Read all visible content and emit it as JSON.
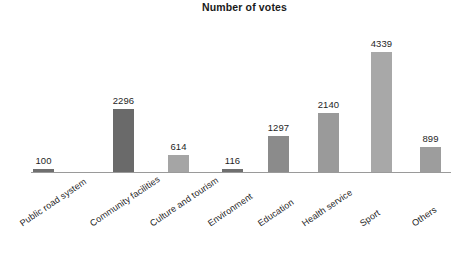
{
  "chart_data": {
    "type": "bar",
    "title": "Number of votes",
    "xlabel": "",
    "ylabel": "",
    "ylim": [
      0,
      4800
    ],
    "grid": false,
    "legend": false,
    "orientation": "vertical",
    "value_labels": true,
    "xtick_rotation": -34,
    "categories": [
      "Public road system",
      "Community facilities",
      "Culture and tourism",
      "Environment",
      "Education",
      "Health service",
      "Sport",
      "Others"
    ],
    "values": [
      100,
      2296,
      614,
      116,
      1297,
      2140,
      4339,
      899
    ],
    "value_label_text": [
      "100",
      "2296",
      "614",
      "116",
      "1297",
      "2140",
      "4339",
      "899"
    ],
    "bar_colors": [
      "#6f6f6f",
      "#6a6a6a",
      "#a5a5a5",
      "#6f6f6f",
      "#8b8b8b",
      "#9a9a9a",
      "#a8a8a8",
      "#9d9d9d"
    ],
    "axis_color": "#9a9a9a",
    "text_color": "#1f1f1f",
    "background": "#ffffff"
  },
  "geometry": {
    "baseline_y": 172,
    "top_y": 52,
    "max_value": 4339,
    "bar_width": 21,
    "bar_left_x": [
      33,
      113,
      168,
      222,
      268,
      318,
      371,
      420
    ],
    "label_anchor_x": [
      18,
      88,
      148,
      206,
      256,
      300,
      358,
      410
    ]
  }
}
